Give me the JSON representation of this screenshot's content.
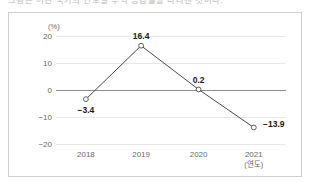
{
  "caption": {
    "text": "그림은 어떤 국가의 연도별 무역 증감률을 나타낸 것이다."
  },
  "chart_data": {
    "type": "line",
    "title": "",
    "xlabel": "(연도)",
    "ylabel": "",
    "unit_label": "(%)",
    "categories": [
      "2018",
      "2019",
      "2020",
      "2021"
    ],
    "x_axis_note": "(연도)",
    "values": [
      -3.4,
      16.4,
      0.2,
      -13.9
    ],
    "point_labels": [
      "−3.4",
      "16.4",
      "0.2",
      "−13.9"
    ],
    "ylim": [
      -20,
      20
    ],
    "yticks": [
      20,
      10,
      0,
      -10,
      -20
    ],
    "ytick_labels": [
      "20",
      "10",
      "0",
      "−10",
      "−20"
    ],
    "grid": true,
    "legend": "none",
    "series": [
      {
        "name": "",
        "values": [
          -3.4,
          16.4,
          0.2,
          -13.9
        ]
      }
    ],
    "marker": "open-circle",
    "line_color": "#4a4a4a",
    "grid_color": "#e8e8e8",
    "zero_line_color": "#8d8d8d",
    "label_color": "#1a1a1a"
  }
}
